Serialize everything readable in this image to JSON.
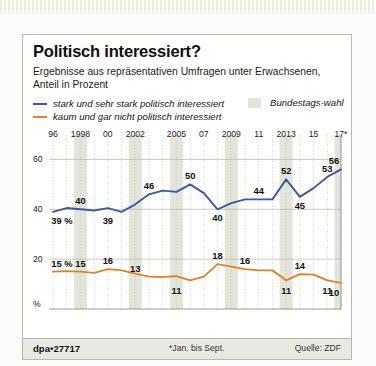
{
  "header": {
    "title": "Politisch interessiert?",
    "subtitle": "Ergebnisse aus repräsentativen Umfragen unter Erwachsenen, Anteil in Prozent"
  },
  "legend": {
    "series": [
      {
        "label": "stark und sehr stark politisch interessiert",
        "color": "#3a5a9b"
      },
      {
        "label": "kaum und gar nicht politisch interessiert",
        "color": "#d8842c"
      }
    ],
    "band": {
      "label": "Bundestags-wahl",
      "color": "#e3e5da"
    }
  },
  "footer": {
    "left": "dpa•27717",
    "center": "*Jan. bis Sept.",
    "right": "Quelle: ZDF"
  },
  "chart_data": {
    "type": "line",
    "title": "Politisch interessiert?",
    "subtitle": "Ergebnisse aus repräsentativen Umfragen unter Erwachsenen, Anteil in Prozent",
    "xlabel": "",
    "ylabel": "%",
    "ylim": [
      0,
      65
    ],
    "yticks": [
      20,
      40,
      60
    ],
    "ytick_labels": [
      "20",
      "40",
      "60"
    ],
    "y_axis_unit_label": "%",
    "grid": true,
    "legend_position": "top-left",
    "x": [
      1996,
      1997,
      1998,
      1999,
      2000,
      2001,
      2002,
      2003,
      2004,
      2005,
      2006,
      2007,
      2008,
      2009,
      2010,
      2011,
      2012,
      2013,
      2014,
      2015,
      2016,
      2017
    ],
    "xticks": [
      1996,
      1998,
      2000,
      2002,
      2005,
      2007,
      2009,
      2011,
      2013,
      2015,
      2017
    ],
    "xtick_labels": [
      "96",
      "1998",
      "00",
      "2002",
      "2005",
      "07",
      "2009",
      "11",
      "2013",
      "15",
      "17*"
    ],
    "shaded_bands": [
      {
        "label": "Bundestagswahl",
        "year": 1998
      },
      {
        "label": "Bundestagswahl",
        "year": 2002
      },
      {
        "label": "Bundestagswahl",
        "year": 2005
      },
      {
        "label": "Bundestagswahl",
        "year": 2009
      },
      {
        "label": "Bundestagswahl",
        "year": 2013
      },
      {
        "label": "Bundestagswahl",
        "year": 2017
      }
    ],
    "series": [
      {
        "name": "stark und sehr stark politisch interessiert",
        "color": "#3a5a9b",
        "values": [
          39,
          40.5,
          40,
          39.5,
          40.5,
          39,
          42,
          46,
          47.5,
          47,
          50,
          46.5,
          40,
          42.5,
          44,
          44,
          44,
          52,
          45,
          48.5,
          53,
          56
        ],
        "labels": [
          {
            "year": 1996,
            "text": "39 %",
            "value": 39,
            "pos": "below"
          },
          {
            "year": 1998,
            "text": "40",
            "value": 40,
            "pos": "above"
          },
          {
            "year": 2000,
            "text": "39",
            "value": 39,
            "pos": "below"
          },
          {
            "year": 2003,
            "text": "46",
            "value": 46,
            "pos": "above"
          },
          {
            "year": 2006,
            "text": "50",
            "value": 50,
            "pos": "above"
          },
          {
            "year": 2008,
            "text": "40",
            "value": 40,
            "pos": "below"
          },
          {
            "year": 2011,
            "text": "44",
            "value": 44,
            "pos": "above"
          },
          {
            "year": 2013,
            "text": "52",
            "value": 52,
            "pos": "above"
          },
          {
            "year": 2014,
            "text": "45",
            "value": 45,
            "pos": "below"
          },
          {
            "year": 2016,
            "text": "53",
            "value": 53,
            "pos": "above"
          },
          {
            "year": 2017,
            "text": "56",
            "value": 56,
            "pos": "above"
          }
        ]
      },
      {
        "name": "kaum und gar nicht politisch interessiert",
        "color": "#d8842c",
        "values": [
          15,
          15.2,
          15,
          14.5,
          16,
          15.5,
          14.2,
          13,
          12.8,
          13.2,
          11.5,
          13,
          18,
          17,
          16,
          15.5,
          15.5,
          11.5,
          14,
          13.8,
          11.5,
          10.5
        ],
        "labels": [
          {
            "year": 1996,
            "text": "15 %",
            "value": 15,
            "pos": "above"
          },
          {
            "year": 1998,
            "text": "15",
            "value": 15,
            "pos": "above"
          },
          {
            "year": 2000,
            "text": "16",
            "value": 16,
            "pos": "above"
          },
          {
            "year": 2002,
            "text": "13",
            "value": 13,
            "pos": "above"
          },
          {
            "year": 2005,
            "text": "11",
            "value": 11,
            "pos": "below"
          },
          {
            "year": 2008,
            "text": "18",
            "value": 18,
            "pos": "above"
          },
          {
            "year": 2010,
            "text": "16",
            "value": 16,
            "pos": "above"
          },
          {
            "year": 2013,
            "text": "11",
            "value": 11,
            "pos": "below"
          },
          {
            "year": 2014,
            "text": "14",
            "value": 14,
            "pos": "above"
          },
          {
            "year": 2016,
            "text": "11",
            "value": 11,
            "pos": "below"
          },
          {
            "year": 2017,
            "text": "10",
            "value": 10,
            "pos": "below"
          }
        ]
      }
    ]
  }
}
